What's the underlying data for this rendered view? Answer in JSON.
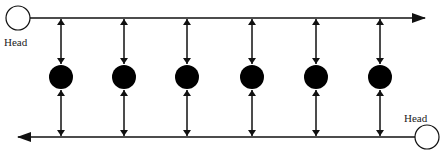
{
  "diagram": {
    "type": "doubly-linked list with two head pointers",
    "top_head": {
      "label": "Head",
      "cx": 18,
      "cy": 18,
      "r": 12
    },
    "bottom_head": {
      "label": "Head",
      "cx": 427,
      "cy": 137,
      "r": 12
    },
    "top_line": {
      "y": 18,
      "x1": 30,
      "x2": 425,
      "direction": "right"
    },
    "bottom_line": {
      "y": 137,
      "x1": 415,
      "x2": 18,
      "direction": "left"
    },
    "nodes": [
      {
        "cx": 61,
        "cy": 77
      },
      {
        "cx": 124,
        "cy": 77
      },
      {
        "cx": 187,
        "cy": 77
      },
      {
        "cx": 252,
        "cy": 77
      },
      {
        "cx": 316,
        "cy": 77
      },
      {
        "cx": 380,
        "cy": 77
      }
    ],
    "node_radius": 12,
    "colors": {
      "line": "#111111",
      "node": "#000000",
      "head_fill": "#ffffff"
    }
  }
}
